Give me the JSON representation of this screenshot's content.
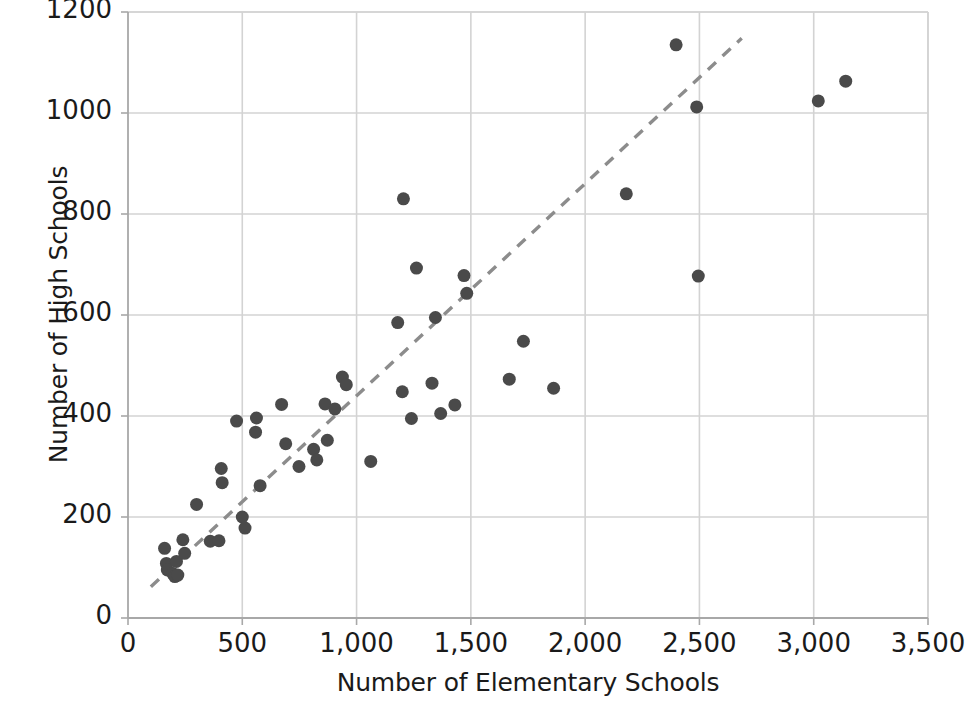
{
  "chart_data": {
    "type": "scatter",
    "title": "",
    "xlabel": "Number of Elementary Schools",
    "ylabel": "Number of High Schools",
    "xlim": [
      0,
      3500
    ],
    "ylim": [
      0,
      1200
    ],
    "xticks": [
      0,
      500,
      1000,
      1500,
      2000,
      2500,
      3000,
      3500
    ],
    "xtick_labels": [
      "0",
      "500",
      "1,000",
      "1,500",
      "2,000",
      "2,500",
      "3,000",
      "3,500"
    ],
    "yticks": [
      0,
      200,
      400,
      600,
      800,
      1000,
      1200
    ],
    "ytick_labels": [
      "0",
      "200",
      "400",
      "600",
      "800",
      "1000",
      "1200"
    ],
    "grid": true,
    "legend": null,
    "marker_color": "#4a4a4a",
    "marker_size": 13,
    "grid_color": "#d3d3d3",
    "axis_color": "#a8a8a8",
    "background": "#ffffff",
    "points": [
      {
        "x": 160,
        "y": 138
      },
      {
        "x": 168,
        "y": 108
      },
      {
        "x": 172,
        "y": 95
      },
      {
        "x": 196,
        "y": 88
      },
      {
        "x": 205,
        "y": 82
      },
      {
        "x": 212,
        "y": 112
      },
      {
        "x": 218,
        "y": 85
      },
      {
        "x": 240,
        "y": 155
      },
      {
        "x": 248,
        "y": 128
      },
      {
        "x": 300,
        "y": 225
      },
      {
        "x": 360,
        "y": 152
      },
      {
        "x": 398,
        "y": 153
      },
      {
        "x": 408,
        "y": 296
      },
      {
        "x": 412,
        "y": 268
      },
      {
        "x": 475,
        "y": 390
      },
      {
        "x": 500,
        "y": 200
      },
      {
        "x": 512,
        "y": 178
      },
      {
        "x": 558,
        "y": 368
      },
      {
        "x": 562,
        "y": 396
      },
      {
        "x": 578,
        "y": 262
      },
      {
        "x": 672,
        "y": 423
      },
      {
        "x": 690,
        "y": 345
      },
      {
        "x": 748,
        "y": 300
      },
      {
        "x": 812,
        "y": 334
      },
      {
        "x": 826,
        "y": 313
      },
      {
        "x": 862,
        "y": 424
      },
      {
        "x": 872,
        "y": 352
      },
      {
        "x": 905,
        "y": 414
      },
      {
        "x": 938,
        "y": 477
      },
      {
        "x": 955,
        "y": 462
      },
      {
        "x": 1062,
        "y": 310
      },
      {
        "x": 1180,
        "y": 585
      },
      {
        "x": 1200,
        "y": 448
      },
      {
        "x": 1205,
        "y": 830
      },
      {
        "x": 1240,
        "y": 395
      },
      {
        "x": 1262,
        "y": 693
      },
      {
        "x": 1330,
        "y": 465
      },
      {
        "x": 1345,
        "y": 595
      },
      {
        "x": 1368,
        "y": 405
      },
      {
        "x": 1430,
        "y": 422
      },
      {
        "x": 1470,
        "y": 678
      },
      {
        "x": 1482,
        "y": 643
      },
      {
        "x": 1668,
        "y": 473
      },
      {
        "x": 1730,
        "y": 548
      },
      {
        "x": 1862,
        "y": 455
      },
      {
        "x": 2180,
        "y": 840
      },
      {
        "x": 2398,
        "y": 1135
      },
      {
        "x": 2488,
        "y": 1012
      },
      {
        "x": 2495,
        "y": 677
      },
      {
        "x": 3020,
        "y": 1024
      },
      {
        "x": 3140,
        "y": 1063
      }
    ],
    "trendline": {
      "style": "dashed",
      "color": "#8c8c8c",
      "x1": 100,
      "y1": 62,
      "x2": 2685,
      "y2": 1148
    }
  }
}
